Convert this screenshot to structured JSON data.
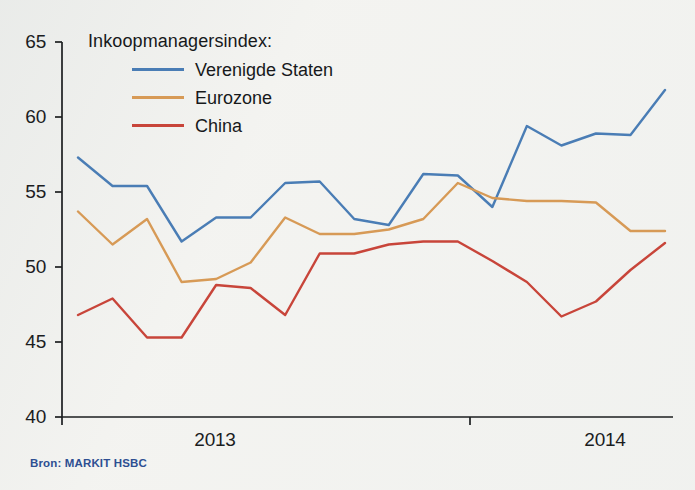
{
  "figure": {
    "background_color": "#f3f3f0",
    "source_note": "Bron: MARKIT HSBC"
  },
  "legend": {
    "title": "Inkoopmanagersindex:",
    "entries": [
      {
        "label": "Verenigde Staten",
        "color": "#4a7db5"
      },
      {
        "label": "Eurozone",
        "color": "#d79a56"
      },
      {
        "label": "China",
        "color": "#c8453a"
      }
    ]
  },
  "axes": {
    "y_ticks": [
      "65",
      "60",
      "55",
      "50",
      "45",
      "40"
    ],
    "x_ticks": [
      "2013",
      "2014"
    ]
  },
  "chart_data": {
    "type": "line",
    "title": "Inkoopmanagersindex:",
    "xlabel": "",
    "ylabel": "",
    "ylim": [
      40,
      65
    ],
    "ytick_values": [
      40,
      45,
      50,
      55,
      60,
      65
    ],
    "grid": false,
    "legend_position": "top-left-inside",
    "x": [
      "2012-11",
      "2012-12",
      "2013-01",
      "2013-02",
      "2013-03",
      "2013-04",
      "2013-05",
      "2013-06",
      "2013-07",
      "2013-08",
      "2013-09",
      "2013-10",
      "2013-11",
      "2013-12",
      "2014-01",
      "2014-02",
      "2014-03",
      "2014-04"
    ],
    "xtick_labels": [
      "2013",
      "2014"
    ],
    "xtick_positions": [
      "2013-02",
      "2014-02"
    ],
    "series": [
      {
        "name": "Verenigde Staten",
        "color": "#4a7db5",
        "values": [
          57.3,
          55.4,
          55.4,
          51.7,
          53.3,
          53.3,
          55.6,
          55.7,
          53.2,
          52.8,
          56.2,
          56.1,
          54.0,
          59.4,
          58.1,
          58.9,
          58.8,
          61.8
        ]
      },
      {
        "name": "Eurozone",
        "color": "#d79a56",
        "values": [
          53.7,
          51.5,
          53.2,
          49.0,
          49.2,
          50.3,
          53.3,
          52.2,
          52.2,
          52.5,
          53.2,
          55.6,
          54.6,
          54.4,
          54.4,
          54.3,
          52.4,
          52.4
        ]
      },
      {
        "name": "China",
        "color": "#c8453a",
        "values": [
          46.8,
          47.9,
          45.3,
          45.3,
          48.8,
          48.6,
          46.8,
          50.9,
          50.9,
          51.5,
          51.7,
          51.7,
          50.4,
          49.0,
          46.7,
          47.7,
          49.8,
          51.6
        ]
      }
    ]
  }
}
